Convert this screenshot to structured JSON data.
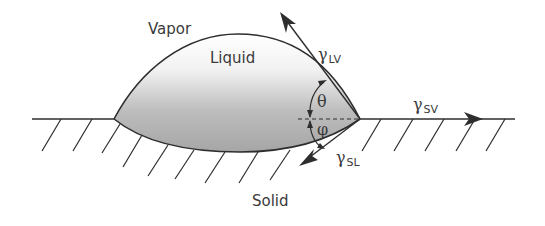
{
  "diagram": {
    "phases": {
      "vapor": "Vapor",
      "liquid": "Liquid",
      "solid": "Solid"
    },
    "tensions": {
      "lv": {
        "symbol": "γ",
        "sub": "LV"
      },
      "sv": {
        "symbol": "γ",
        "sub": "SV"
      },
      "sl": {
        "symbol": "γ",
        "sub": "SL"
      }
    },
    "angles": {
      "theta": "θ",
      "phi": "φ"
    },
    "colors": {
      "line": "#2e2e2e",
      "text": "#3a3a3a",
      "liquid_top": "#ffffff",
      "liquid_bottom": "#a8a8a8"
    }
  }
}
